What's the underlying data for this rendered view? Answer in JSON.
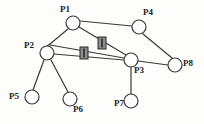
{
  "figure": {
    "type": "node-link-graph",
    "background_color": "#fdfdfb",
    "stroke_color": "#3a3a3a",
    "node_fill_color": "#ffffff",
    "node_radius": 7,
    "edge_width": 1.2,
    "label_color": "#232323",
    "marker_fill_color": "#8d8d8d",
    "marker_stroke_color": "#2b2b2b",
    "marker_bar_color": "#2b2b2b",
    "width": 204,
    "height": 124
  },
  "nodes": [
    {
      "id": "P1",
      "label": "P1",
      "cx": 73,
      "cy": 23,
      "label_x": 60,
      "label_y": 5
    },
    {
      "id": "P2",
      "label": "P2",
      "cx": 47,
      "cy": 53,
      "label_x": 24,
      "label_y": 41
    },
    {
      "id": "P3",
      "label": "P3",
      "cx": 131,
      "cy": 60,
      "label_x": 134,
      "label_y": 66
    },
    {
      "id": "P4",
      "label": "P4",
      "cx": 139,
      "cy": 27,
      "label_x": 143,
      "label_y": 8
    },
    {
      "id": "P5",
      "label": "P5",
      "cx": 32,
      "cy": 97,
      "label_x": 9,
      "label_y": 92
    },
    {
      "id": "P6",
      "label": "P6",
      "cx": 70,
      "cy": 99,
      "label_x": 73,
      "label_y": 105
    },
    {
      "id": "P7",
      "label": "P7",
      "cx": 131,
      "cy": 101,
      "label_x": 114,
      "label_y": 99
    },
    {
      "id": "P8",
      "label": "P8",
      "cx": 175,
      "cy": 65,
      "label_x": 183,
      "label_y": 59
    }
  ],
  "junctions": [
    {
      "id": "J1",
      "x": 50,
      "y": 44
    }
  ],
  "edges": [
    {
      "id": "e-p1-p4",
      "from": "P1",
      "to": "P4",
      "x1": 80,
      "y1": 21,
      "x2": 132,
      "y2": 26
    },
    {
      "id": "e-p1-j1",
      "from": "P1",
      "to": "J1",
      "x1": 68,
      "y1": 29,
      "x2": 50,
      "y2": 44
    },
    {
      "id": "e-j1-p2",
      "from": "J1",
      "to": "P2",
      "x1": 50,
      "y1": 44,
      "x2": 47,
      "y2": 46
    },
    {
      "id": "e-p1-p3",
      "from": "P1",
      "to": "P3",
      "x1": 79,
      "y1": 27,
      "x2": 126,
      "y2": 55
    },
    {
      "id": "e-j1-p3",
      "from": "J1",
      "to": "P3",
      "x1": 50,
      "y1": 45,
      "x2": 124,
      "y2": 58
    },
    {
      "id": "e-p2-p3",
      "from": "P2",
      "to": "P3",
      "x1": 54,
      "y1": 54,
      "x2": 124,
      "y2": 60
    },
    {
      "id": "e-p2-p5",
      "from": "P2",
      "to": "P5",
      "x1": 44,
      "y1": 60,
      "x2": 33,
      "y2": 90
    },
    {
      "id": "e-p2-p6",
      "from": "P2",
      "to": "P6",
      "x1": 51,
      "y1": 60,
      "x2": 68,
      "y2": 92
    },
    {
      "id": "e-p3-p7",
      "from": "P3",
      "to": "P7",
      "x1": 131,
      "y1": 67,
      "x2": 131,
      "y2": 94
    },
    {
      "id": "e-p3-p8",
      "from": "P3",
      "to": "P8",
      "x1": 138,
      "y1": 61,
      "x2": 168,
      "y2": 65
    },
    {
      "id": "e-p4-p8",
      "from": "P4",
      "to": "P8",
      "x1": 143,
      "y1": 34,
      "x2": 172,
      "y2": 58
    }
  ],
  "edge_markers": [
    {
      "id": "m1",
      "on_edge": "e-p1-p3",
      "x": 98,
      "y": 37,
      "w": 8,
      "h": 12
    },
    {
      "id": "m2",
      "on_edge": "e-p2-p3",
      "x": 80,
      "y": 47,
      "w": 8,
      "h": 12
    }
  ]
}
